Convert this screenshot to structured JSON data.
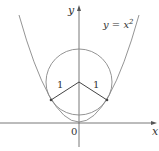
{
  "diagram": {
    "axes": {
      "x_label": "x",
      "y_label": "y",
      "origin_label": "0"
    },
    "curve": {
      "label_lhs": "y = x",
      "label_exp": "2",
      "equation": "y = x^2"
    },
    "circle": {
      "radius_label_left": "1",
      "radius_label_right": "1"
    },
    "colors": {
      "axis": "#555555",
      "curve": "#888888",
      "radius": "#444444",
      "text": "#333333"
    }
  }
}
